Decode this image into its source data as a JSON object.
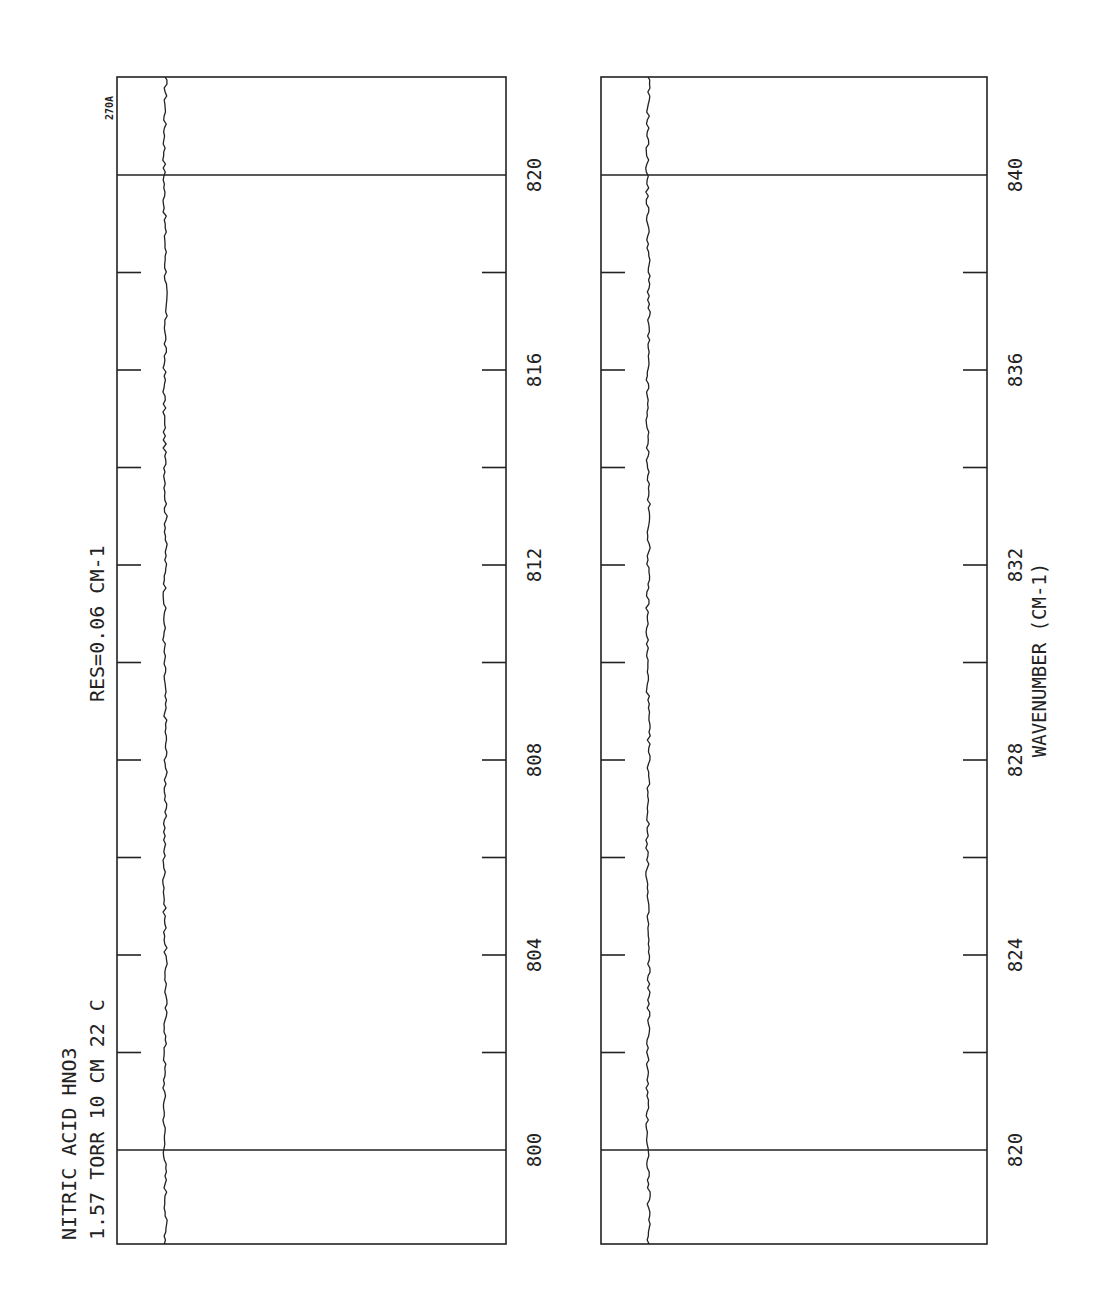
{
  "header": {
    "title_line1": "NITRIC ACID  HNO3",
    "title_line2": "1.57 TORR  10 CM  22 C",
    "resolution": "RES=0.06 CM-1",
    "plate_id": "270A"
  },
  "axis": {
    "xlabel": "WAVENUMBER (CM-1)"
  },
  "chart_data": [
    {
      "type": "line",
      "title": "NITRIC ACID HNO3 — 1.57 TORR 10 CM 22 C — RES=0.06 CM-1",
      "xlabel": "WAVENUMBER (CM-1)",
      "ylabel": "Transmittance",
      "xlim": [
        798,
        822
      ],
      "ylim": [
        0,
        1
      ],
      "grid": false,
      "major_ticks": [
        "800",
        "804",
        "808",
        "812",
        "816",
        "820"
      ],
      "minor_ticks": [
        802,
        806,
        810,
        814,
        818
      ],
      "reference_lines": [
        800,
        820
      ],
      "series": [
        {
          "name": "HNO3 spectrum",
          "description": "Nearly flat trace near full transmittance (~0.88) with small noise ripple, no significant absorption features",
          "x": [
            798,
            800,
            802,
            804,
            806,
            808,
            810,
            812,
            814,
            816,
            818,
            820,
            822
          ],
          "values": [
            0.88,
            0.88,
            0.88,
            0.88,
            0.88,
            0.88,
            0.88,
            0.88,
            0.88,
            0.88,
            0.88,
            0.88,
            0.88
          ]
        }
      ]
    },
    {
      "type": "line",
      "title": "",
      "xlabel": "WAVENUMBER (CM-1)",
      "ylabel": "Transmittance",
      "xlim": [
        818,
        842
      ],
      "ylim": [
        0,
        1
      ],
      "grid": false,
      "major_ticks": [
        "820",
        "824",
        "828",
        "832",
        "836",
        "840"
      ],
      "minor_ticks": [
        822,
        826,
        830,
        834,
        838
      ],
      "reference_lines": [
        820,
        840
      ],
      "series": [
        {
          "name": "HNO3 spectrum",
          "description": "Nearly flat trace near full transmittance (~0.88) with small noise ripple, no significant absorption features",
          "x": [
            818,
            820,
            822,
            824,
            826,
            828,
            830,
            832,
            834,
            836,
            838,
            840,
            842
          ],
          "values": [
            0.88,
            0.88,
            0.88,
            0.88,
            0.88,
            0.88,
            0.88,
            0.88,
            0.88,
            0.88,
            0.88,
            0.88,
            0.88
          ]
        }
      ]
    }
  ],
  "panels": [
    {
      "id": "left",
      "tick_labels": [
        "800",
        "804",
        "808",
        "812",
        "816",
        "820"
      ]
    },
    {
      "id": "right",
      "tick_labels": [
        "820",
        "824",
        "828",
        "832",
        "836",
        "840"
      ]
    }
  ]
}
